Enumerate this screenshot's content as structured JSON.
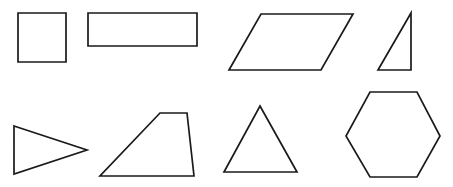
{
  "diagram": {
    "background": "#ffffff",
    "stroke_color": "#1a1a1a",
    "shapes": [
      {
        "name": "square",
        "type": "polygon",
        "points": "18,13 66,13 66,62 18,62"
      },
      {
        "name": "rectangle",
        "type": "polygon",
        "points": "88,13 197,13 197,46 88,46"
      },
      {
        "name": "parallelogram",
        "type": "polygon",
        "points": "261,14 353,14 321,70 229,70"
      },
      {
        "name": "right-triangle",
        "type": "polygon",
        "points": "411,13 411,70 378,70"
      },
      {
        "name": "isosceles-triangle",
        "type": "polygon",
        "points": "14,126 87,150 14,174"
      },
      {
        "name": "trapezoid",
        "type": "polygon",
        "points": "160,113 187,113 194,176 100,176"
      },
      {
        "name": "equilateral-triangle",
        "type": "polygon",
        "points": "260,106 297,172 224,172"
      },
      {
        "name": "hexagon",
        "type": "polygon",
        "points": "370,92 417,92 440,136 417,177 370,177 346,136"
      }
    ]
  }
}
